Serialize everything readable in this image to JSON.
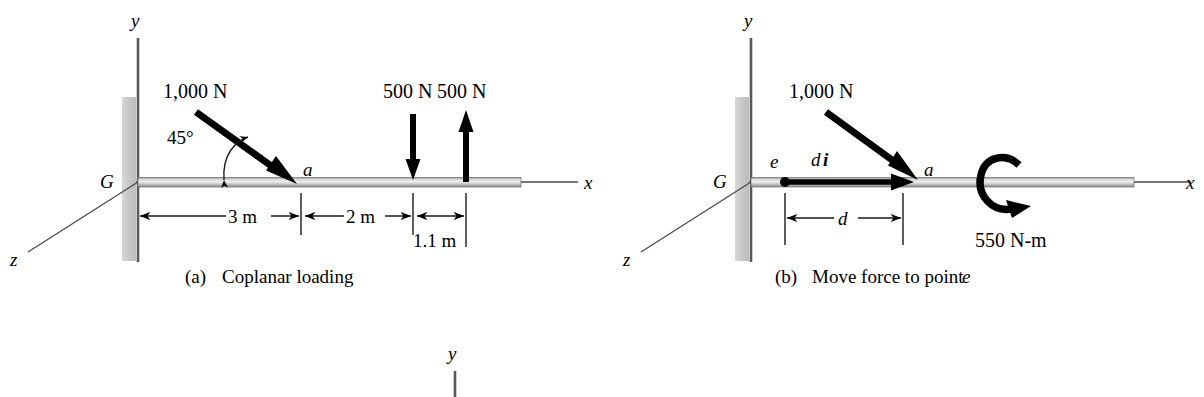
{
  "figure": {
    "panels": [
      {
        "id": "a",
        "caption_tag": "(a)",
        "caption_text": "Coplanar loading",
        "axes": {
          "y": "y",
          "x": "x",
          "z": "z"
        },
        "origin_label": "G",
        "point_label_a": "a",
        "angle_label": "45°",
        "loads": [
          {
            "name": "inclined-force",
            "label": "1,000 N",
            "direction": "down-right-45"
          },
          {
            "name": "down-force",
            "label": "500 N",
            "direction": "down"
          },
          {
            "name": "up-force",
            "label": "500 N",
            "direction": "up"
          }
        ],
        "dimensions": [
          {
            "name": "dim-3m",
            "label": "3 m"
          },
          {
            "name": "dim-2m",
            "label": "2 m"
          },
          {
            "name": "dim-1p1m",
            "label": "1.1 m"
          }
        ]
      },
      {
        "id": "b",
        "caption_tag": "(b)",
        "caption_text": "Move force to point",
        "caption_italic_tail": "e",
        "axes": {
          "y": "y",
          "x": "x",
          "z": "z"
        },
        "origin_label": "G",
        "point_label_a": "a",
        "point_label_e": "e",
        "vector_label_d": "d",
        "vector_label_i": "i",
        "loads": [
          {
            "name": "inclined-force",
            "label": "1,000 N",
            "direction": "down-right-45"
          },
          {
            "name": "couple-moment",
            "label": "550 N-m",
            "direction": "clockwise"
          }
        ],
        "dimensions": [
          {
            "name": "dim-d",
            "label": "d"
          }
        ]
      },
      {
        "id": "c-partial",
        "axes": {
          "y": "y"
        }
      }
    ],
    "colors": {
      "ink": "#000000",
      "axis_gray": "#4a4a4a",
      "wall_gray": "#c9c9c9",
      "beam_light": "#e2e2e2",
      "beam_mid": "#b6b6b6",
      "beam_dark": "#7d7d7d",
      "background": "#ffffff"
    }
  }
}
